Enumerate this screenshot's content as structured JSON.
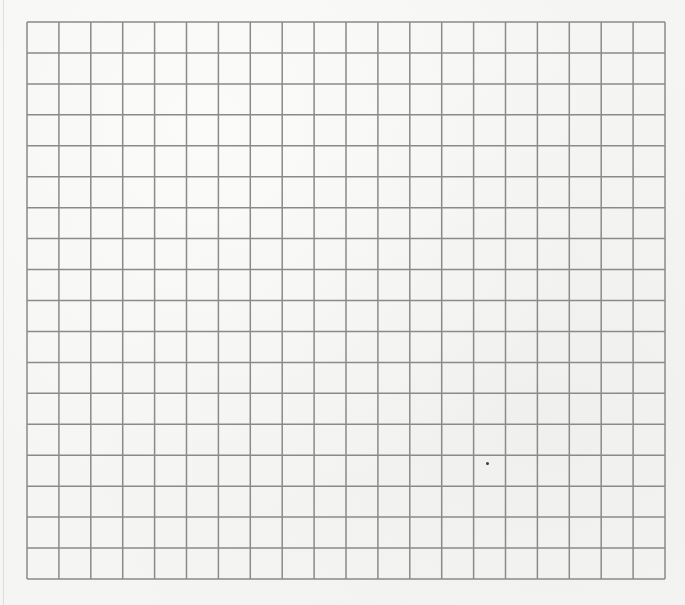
{
  "sheet": {
    "type": "graph-paper",
    "columns": 20,
    "rows": 18,
    "grid_origin": [
      27,
      22
    ],
    "grid_size": [
      638,
      557
    ],
    "line_color": "#8a8a8a",
    "paper_color": "#f5f5f3",
    "line_width": 1.5
  },
  "marks": [
    {
      "name": "ink-speck",
      "x": 486,
      "y": 462
    }
  ]
}
